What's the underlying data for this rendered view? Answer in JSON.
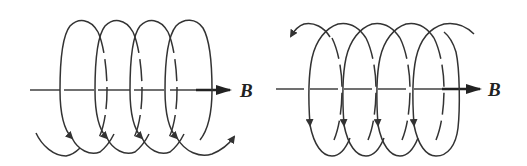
{
  "diagram": {
    "colors": {
      "stroke": "#333333",
      "background": "#ffffff"
    },
    "figures": [
      {
        "id": "left",
        "field_label": "B",
        "field_direction": "right",
        "loops": 4,
        "rotation": "front strands move downward, exit arrow at bottom-right pointing up-right"
      },
      {
        "id": "right",
        "field_label": "B",
        "field_direction": "right",
        "loops": 4,
        "rotation": "front strands move downward, entry arrow at top-left pointing down-left"
      }
    ]
  }
}
